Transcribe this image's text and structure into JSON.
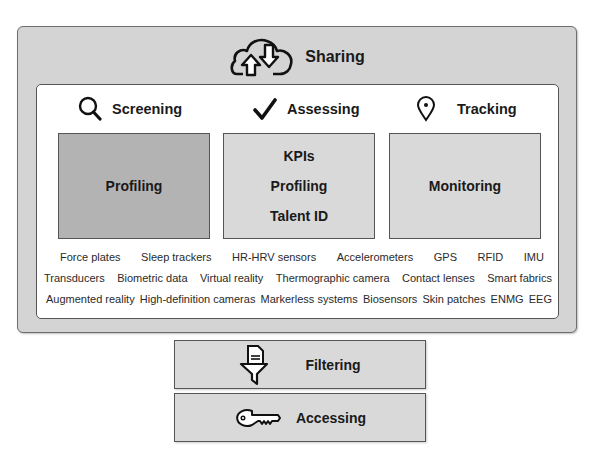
{
  "sharing": {
    "label": "Sharing",
    "icon": "cloud-sync-icon"
  },
  "categories": [
    {
      "label": "Screening",
      "icon": "search-icon"
    },
    {
      "label": "Assessing",
      "icon": "checkmark-icon"
    },
    {
      "label": "Tracking",
      "icon": "location-pin-icon"
    }
  ],
  "boxes": [
    {
      "items": [
        "Profiling"
      ],
      "fill": "#b3b3b3"
    },
    {
      "items": [
        "KPIs",
        "Profiling",
        "Talent ID"
      ],
      "fill": "#d9d9d9"
    },
    {
      "items": [
        "Monitoring"
      ],
      "fill": "#d9d9d9"
    }
  ],
  "technologies": {
    "row1": [
      "Force plates",
      "Sleep trackers",
      "HR-HRV sensors",
      "Accelerometers",
      "GPS",
      "RFID",
      "IMU"
    ],
    "row2": [
      "Transducers",
      "Biometric data",
      "Virtual reality",
      "Thermographic camera",
      "Contact lenses",
      "Smart fabrics"
    ],
    "row3": [
      "Augmented reality",
      "High-definition cameras",
      "Markerless systems",
      "Biosensors",
      "Skin patches",
      "ENMG",
      "EEG"
    ]
  },
  "filtering": {
    "label": "Filtering",
    "icon": "document-funnel-icon"
  },
  "accessing": {
    "label": "Accessing",
    "icon": "key-icon"
  },
  "colors": {
    "outer_fill": "#d4d4d4",
    "box_fill": "#d9d9d9",
    "box_dark_fill": "#b3b3b3",
    "border": "#555555"
  }
}
